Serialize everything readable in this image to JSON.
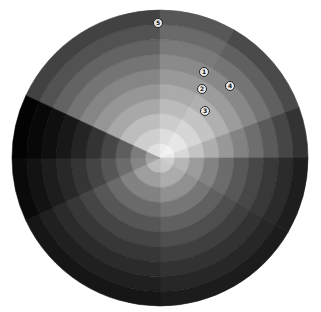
{
  "image": {
    "description": "Grayscale radial wheel (sunburst) with concentric rings and angular sectors, numbered markers",
    "center": [
      160,
      158
    ],
    "radius": 148,
    "rings": 10
  },
  "sectors": [
    {
      "start": 90,
      "end": 155,
      "shades": [
        "#e0e0e0",
        "#cfcfcf",
        "#bdbdbd",
        "#a8a8a8",
        "#969696",
        "#858585",
        "#747474",
        "#636363",
        "#525252",
        "#424242"
      ]
    },
    {
      "start": 60,
      "end": 90,
      "shades": [
        "#ececec",
        "#dddddd",
        "#cccccc",
        "#bbbbbb",
        "#aaaaaa",
        "#999999",
        "#8a8a8a",
        "#7a7a7a",
        "#6a6a6a",
        "#575757"
      ]
    },
    {
      "start": 20,
      "end": 60,
      "shades": [
        "#f2f2f2",
        "#e6e6e6",
        "#d6d6d6",
        "#c4c4c4",
        "#b0b0b0",
        "#9c9c9c",
        "#888888",
        "#747474",
        "#606060",
        "#4a4a4a"
      ]
    },
    {
      "start": 0,
      "end": 20,
      "shades": [
        "#eaeaea",
        "#d8d8d8",
        "#c4c4c4",
        "#aeaeae",
        "#989898",
        "#828282",
        "#6e6e6e",
        "#5a5a5a",
        "#464646",
        "#333333"
      ]
    },
    {
      "start": -30,
      "end": 0,
      "shades": [
        "#cfcfcf",
        "#b6b6b6",
        "#9c9c9c",
        "#838383",
        "#6c6c6c",
        "#585858",
        "#474747",
        "#383838",
        "#2b2b2b",
        "#1e1e1e"
      ]
    },
    {
      "start": -90,
      "end": -30,
      "shades": [
        "#c8c8c8",
        "#acacac",
        "#909090",
        "#767676",
        "#606060",
        "#4e4e4e",
        "#3f3f3f",
        "#323232",
        "#272727",
        "#1c1c1c"
      ]
    },
    {
      "start": -155,
      "end": -90,
      "shades": [
        "#bcbcbc",
        "#9e9e9e",
        "#828282",
        "#6a6a6a",
        "#565656",
        "#454545",
        "#373737",
        "#2b2b2b",
        "#202020",
        "#161616"
      ]
    },
    {
      "start": 180,
      "end": 205,
      "shades": [
        "#a4a4a4",
        "#868686",
        "#6c6c6c",
        "#565656",
        "#444444",
        "#353535",
        "#282828",
        "#1d1d1d",
        "#131313",
        "#0a0a0a"
      ]
    },
    {
      "start": 155,
      "end": 180,
      "shades": [
        "#9c9c9c",
        "#7c7c7c",
        "#5e5e5e",
        "#464646",
        "#333333",
        "#242424",
        "#181818",
        "#0f0f0f",
        "#080808",
        "#030303"
      ]
    }
  ],
  "markers": [
    {
      "label": "1",
      "x": 204,
      "y": 72
    },
    {
      "label": "2",
      "x": 202,
      "y": 89
    },
    {
      "label": "3",
      "x": 205,
      "y": 111
    },
    {
      "label": "4",
      "x": 230,
      "y": 86
    },
    {
      "label": "5",
      "x": 158,
      "y": 23
    }
  ]
}
